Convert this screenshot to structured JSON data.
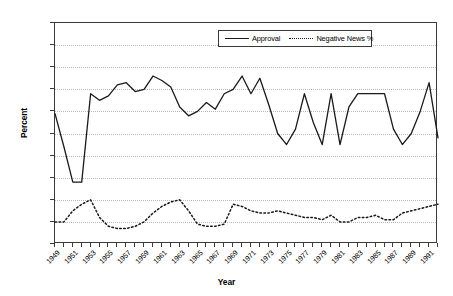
{
  "chart_data": {
    "type": "line",
    "title": "",
    "xlabel": "Year",
    "ylabel": "Percent",
    "ylim": [
      0,
      100
    ],
    "ytick_step": 10,
    "yticks": [
      0,
      10,
      20,
      30,
      40,
      50,
      60,
      70,
      80,
      90,
      100
    ],
    "xlim": [
      1949,
      1992
    ],
    "xtick_labels": [
      "1949",
      "1951",
      "1953",
      "1955",
      "1957",
      "1959",
      "1961",
      "1963",
      "1965",
      "1967",
      "1969",
      "1971",
      "1973",
      "1975",
      "1977",
      "1979",
      "1981",
      "1983",
      "1985",
      "1987",
      "1989",
      "1991"
    ],
    "xtick_label_interval": 2,
    "grid": "horizontal-dotted",
    "legend_position": "top-center-inside",
    "x": [
      1949,
      1950,
      1951,
      1952,
      1953,
      1954,
      1955,
      1956,
      1957,
      1958,
      1959,
      1960,
      1961,
      1962,
      1963,
      1964,
      1965,
      1966,
      1967,
      1968,
      1969,
      1970,
      1971,
      1972,
      1973,
      1974,
      1975,
      1976,
      1977,
      1978,
      1979,
      1980,
      1981,
      1982,
      1983,
      1984,
      1985,
      1986,
      1987,
      1988,
      1989,
      1990,
      1991,
      1992
    ],
    "series": [
      {
        "name": "Approval",
        "style": "solid",
        "color": "#1a1a1a",
        "values": [
          59,
          44,
          28,
          28,
          68,
          65,
          67,
          72,
          73,
          69,
          70,
          76,
          74,
          71,
          62,
          58,
          60,
          64,
          61,
          68,
          70,
          76,
          68,
          75,
          63,
          50,
          45,
          52,
          68,
          55,
          45,
          68,
          45,
          62,
          68,
          68,
          68,
          68,
          52,
          45,
          50,
          60,
          73,
          48
        ]
      },
      {
        "name": "Negative News %",
        "style": "dashed",
        "color": "#1a1a1a",
        "values": [
          10,
          10,
          15,
          18,
          20,
          12,
          8,
          7,
          7,
          8,
          10,
          14,
          17,
          19,
          20,
          15,
          9,
          8,
          8,
          9,
          18,
          17,
          15,
          14,
          14,
          15,
          14,
          13,
          12,
          12,
          11,
          13,
          10,
          10,
          12,
          12,
          13,
          11,
          11,
          14,
          15,
          16,
          17,
          18
        ]
      }
    ],
    "annotations": []
  },
  "legend": {
    "items": [
      {
        "label": "Approval",
        "style": "solid"
      },
      {
        "label": "Negative News %",
        "style": "dashed"
      }
    ]
  }
}
